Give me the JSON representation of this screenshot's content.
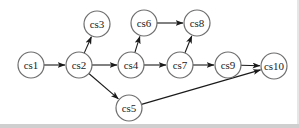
{
  "diagram": {
    "type": "directed-graph",
    "colors": {
      "node_stroke": "#6e6e6e",
      "edge": "#1a1a1a",
      "background": "#ffffff"
    },
    "node_radius": 13,
    "nodes": [
      {
        "id": "cs1",
        "label": "cs1",
        "x": 31,
        "y": 65
      },
      {
        "id": "cs2",
        "label": "cs2",
        "x": 79,
        "y": 65
      },
      {
        "id": "cs3",
        "label": "cs3",
        "x": 97,
        "y": 24
      },
      {
        "id": "cs4",
        "label": "cs4",
        "x": 131,
        "y": 65
      },
      {
        "id": "cs5",
        "label": "cs5",
        "x": 129,
        "y": 108
      },
      {
        "id": "cs6",
        "label": "cs6",
        "x": 144,
        "y": 23
      },
      {
        "id": "cs7",
        "label": "cs7",
        "x": 180,
        "y": 65
      },
      {
        "id": "cs8",
        "label": "cs8",
        "x": 197,
        "y": 23
      },
      {
        "id": "cs9",
        "label": "cs9",
        "x": 228,
        "y": 65
      },
      {
        "id": "cs10",
        "label": "cs10",
        "x": 274,
        "y": 66
      }
    ],
    "edges": [
      {
        "from": "cs1",
        "to": "cs2"
      },
      {
        "from": "cs2",
        "to": "cs3"
      },
      {
        "from": "cs2",
        "to": "cs4"
      },
      {
        "from": "cs2",
        "to": "cs5"
      },
      {
        "from": "cs4",
        "to": "cs6"
      },
      {
        "from": "cs4",
        "to": "cs7"
      },
      {
        "from": "cs6",
        "to": "cs8"
      },
      {
        "from": "cs7",
        "to": "cs8"
      },
      {
        "from": "cs7",
        "to": "cs9"
      },
      {
        "from": "cs9",
        "to": "cs10"
      },
      {
        "from": "cs5",
        "to": "cs10"
      }
    ]
  }
}
